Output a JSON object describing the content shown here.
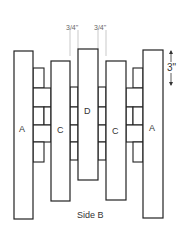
{
  "diagram": {
    "caption": "Side B",
    "dimensions": {
      "gap_left": "3/4\"",
      "gap_right": "3/4\"",
      "block_height": "3\""
    },
    "boards": [
      {
        "label": "A"
      },
      {
        "label": "C"
      },
      {
        "label": "D"
      },
      {
        "label": "C"
      },
      {
        "label": "A"
      }
    ]
  }
}
